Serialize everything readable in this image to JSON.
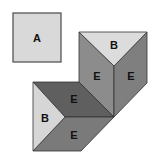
{
  "diagram": {
    "square": {
      "label": "A",
      "color": "#d9d9d9"
    },
    "faces": [
      {
        "id": "top-triangle",
        "label": "B",
        "color": "#dcdcdc"
      },
      {
        "id": "vertical-left",
        "label": "E",
        "color": "#8c8c8c"
      },
      {
        "id": "vertical-right",
        "label": "E",
        "color": "#7f7f7f"
      },
      {
        "id": "dark-parallelogram",
        "label": "E",
        "color": "#5f5f5f"
      },
      {
        "id": "left-triangle",
        "label": "B",
        "color": "#d6d6d6"
      },
      {
        "id": "bottom-parallelogram",
        "label": "E",
        "color": "#7a7a7a"
      }
    ],
    "edge_color": "#333333"
  }
}
